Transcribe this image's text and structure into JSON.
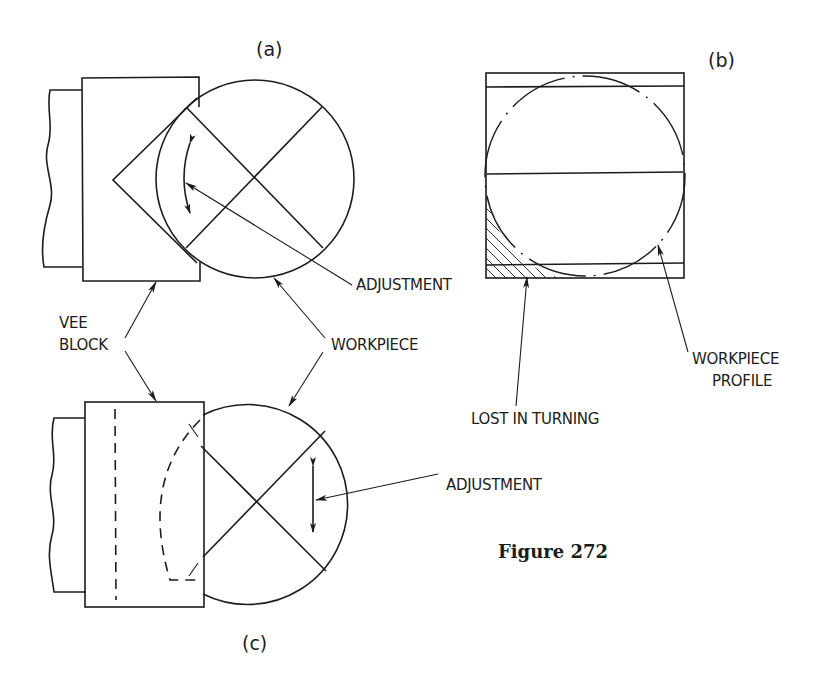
{
  "figure": {
    "caption": "Figure 272",
    "panels": {
      "a": {
        "label": "(a)",
        "callouts": {
          "adjustment": "ADJUSTMENT"
        }
      },
      "b": {
        "label": "(b)",
        "callouts": {
          "lost_in_turning": "LOST IN TURNING",
          "workpiece_profile_line1": "WORKPIECE",
          "workpiece_profile_line2": "PROFILE"
        }
      },
      "c": {
        "label": "(c)",
        "callouts": {
          "adjustment": "ADJUSTMENT"
        }
      }
    },
    "shared_callouts": {
      "vee_block_line1": "VEE",
      "vee_block_line2": "BLOCK",
      "workpiece": "WORKPIECE"
    },
    "colors": {
      "ink": "#1c1c1c",
      "paper": "#ffffff"
    }
  }
}
